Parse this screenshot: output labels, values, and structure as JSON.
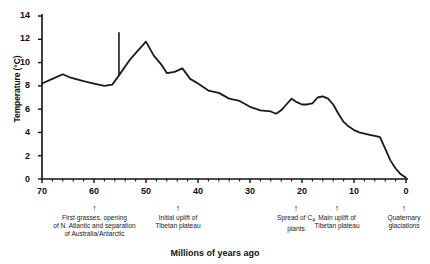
{
  "chart_data": {
    "type": "line",
    "title": "",
    "xlabel": "Millions of years ago",
    "ylabel": "Temperature (°C)",
    "xlim": [
      70,
      0
    ],
    "ylim": [
      0,
      14
    ],
    "x_ticks": [
      70,
      60,
      50,
      40,
      30,
      20,
      10,
      0
    ],
    "x_tick_labels": [
      "70",
      "60",
      "50",
      "40",
      "30",
      "20",
      "10",
      "0"
    ],
    "x_minor_tick_step": 2,
    "y_ticks": [
      0,
      2,
      4,
      6,
      8,
      10,
      12,
      14
    ],
    "y_tick_labels": [
      "0",
      "2",
      "4",
      "6",
      "8",
      "10",
      "12",
      "14"
    ],
    "x_axis_reversed": true,
    "grid": false,
    "legend": null,
    "line_color": "#1a1a1a",
    "series": [
      {
        "name": "Global temperature",
        "x": [
          70.0,
          68.0,
          66.0,
          64.5,
          62.0,
          60.0,
          58.0,
          56.5,
          55.2,
          53.0,
          51.0,
          50.0,
          48.5,
          47.0,
          46.0,
          44.5,
          43.0,
          41.5,
          40.0,
          38.0,
          36.0,
          34.0,
          32.0,
          30.0,
          28.0,
          26.0,
          25.0,
          24.0,
          23.0,
          22.0,
          21.0,
          20.0,
          19.0,
          18.0,
          17.0,
          16.0,
          15.0,
          14.0,
          13.0,
          12.0,
          11.0,
          10.0,
          9.0,
          8.0,
          7.0,
          6.0,
          5.0,
          4.0,
          3.0,
          2.0,
          1.0,
          0.0
        ],
        "y": [
          8.2,
          8.6,
          9.0,
          8.7,
          8.4,
          8.2,
          8.0,
          8.1,
          8.9,
          10.3,
          11.3,
          11.8,
          10.6,
          9.8,
          9.1,
          9.2,
          9.5,
          8.6,
          8.2,
          7.6,
          7.4,
          6.9,
          6.7,
          6.2,
          5.9,
          5.8,
          5.6,
          5.9,
          6.4,
          6.9,
          6.6,
          6.4,
          6.4,
          6.5,
          7.0,
          7.1,
          6.9,
          6.4,
          5.6,
          4.9,
          4.5,
          4.2,
          4.0,
          3.9,
          3.8,
          3.7,
          3.6,
          2.6,
          1.6,
          0.9,
          0.4,
          0.1
        ]
      }
    ],
    "spike": {
      "name": "PETM thermal spike",
      "x": 55.2,
      "y_base": 8.9,
      "y_top": 12.6
    },
    "annotations": [
      {
        "x": 60,
        "text": "First grasses, opening\nof N. Atlantic and separation\nof Australia/Antarctic"
      },
      {
        "x": 44,
        "text": "Initial uplift of\nTibetan plateau"
      },
      {
        "x": 22,
        "text_pre": "Spread of C",
        "text_sub": "4",
        "text_post": "\nplants"
      },
      {
        "x": 14,
        "text": "Main uplift of\nTibetan plateau"
      },
      {
        "x": 1,
        "text": "Quaternary\nglaciations"
      }
    ]
  }
}
